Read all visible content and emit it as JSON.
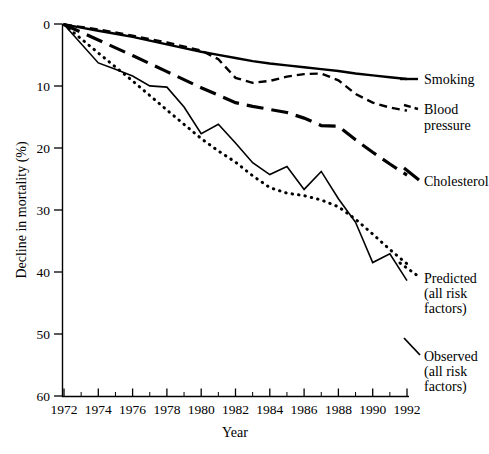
{
  "chart_data": {
    "type": "line",
    "title": "",
    "xlabel": "Year",
    "ylabel": "Decline in mortality (%)",
    "xlim": [
      1972,
      1992
    ],
    "ylim": [
      0,
      60
    ],
    "y_inverted": true,
    "grid": false,
    "legend_position": "right-inline-labels",
    "x_ticks_major": [
      1972,
      1974,
      1976,
      1978,
      1980,
      1982,
      1984,
      1986,
      1988,
      1990,
      1992
    ],
    "x_tick_labels": [
      "1972",
      "1974",
      "1976",
      "1978",
      "1980",
      "1982",
      "1984",
      "1986",
      "1988",
      "1990",
      "1992"
    ],
    "x_ticks_minor": [
      1973,
      1975,
      1977,
      1979,
      1981,
      1983,
      1985,
      1987,
      1989,
      1991
    ],
    "y_ticks": [
      0,
      10,
      20,
      30,
      40,
      50,
      60
    ],
    "y_tick_labels": [
      "0",
      "10",
      "20",
      "30",
      "40",
      "50",
      "60"
    ],
    "x": [
      1972,
      1973,
      1974,
      1975,
      1976,
      1977,
      1978,
      1979,
      1980,
      1981,
      1982,
      1983,
      1984,
      1985,
      1986,
      1987,
      1988,
      1989,
      1990,
      1991,
      1992
    ],
    "series": [
      {
        "name": "Smoking",
        "label": "Smoking",
        "style": "solid",
        "values": [
          0.0,
          0.6,
          1.2,
          1.8,
          2.4,
          3.0,
          3.6,
          4.2,
          4.8,
          5.2,
          5.6,
          6.0,
          6.3,
          6.6,
          6.9,
          7.2,
          7.5,
          7.8,
          8.1,
          8.4,
          8.7
        ]
      },
      {
        "name": "Blood pressure",
        "label": "Blood\npressure",
        "label_lines": [
          "Blood",
          "pressure"
        ],
        "style": "dashed",
        "values": [
          0.0,
          0.4,
          0.9,
          1.5,
          2.1,
          2.7,
          3.3,
          4.0,
          4.8,
          6.3,
          9.0,
          8.8,
          8.6,
          8.3,
          7.8,
          8.6,
          9.4,
          10.8,
          12.0,
          13.0,
          13.7
        ]
      },
      {
        "name": "Cholesterol",
        "label": "Cholesterol",
        "style": "long-dash",
        "values": [
          0.0,
          1.3,
          2.6,
          3.9,
          5.2,
          6.5,
          7.8,
          9.1,
          10.4,
          11.6,
          12.7,
          13.3,
          13.9,
          14.5,
          15.1,
          16.3,
          16.4,
          18.8,
          21.1,
          22.6,
          24.0
        ]
      },
      {
        "name": "Predicted (all risk factors)",
        "label_lines": [
          "Predicted",
          "(all risk",
          "factors)"
        ],
        "style": "dotted",
        "values": [
          0.0,
          2.2,
          4.6,
          7.0,
          9.3,
          11.7,
          14.0,
          16.4,
          18.5,
          20.3,
          22.0,
          24.0,
          26.0,
          27.2,
          27.8,
          28.2,
          29.2,
          31.2,
          33.8,
          36.2,
          38.5
        ]
      },
      {
        "name": "Observed (all risk factors)",
        "label_lines": [
          "Observed",
          "(all risk",
          "factors)"
        ],
        "style": "solid-thin",
        "values": [
          0.0,
          3.2,
          6.2,
          7.3,
          8.4,
          10.0,
          10.1,
          13.2,
          17.5,
          16.2,
          19.0,
          22.2,
          24.0,
          23.0,
          26.5,
          23.8,
          28.0,
          32.0,
          38.5,
          37.0,
          41.3
        ]
      }
    ],
    "observed_points": [
      [
        1972,
        0.0
      ],
      [
        1973,
        3.2
      ],
      [
        1974,
        6.2
      ],
      [
        1975,
        7.3
      ],
      [
        1976,
        8.4
      ],
      [
        1977,
        10.0
      ],
      [
        1978,
        10.1
      ],
      [
        1979,
        13.2
      ],
      [
        1980,
        17.5
      ],
      [
        1981,
        16.2
      ],
      [
        1982,
        19.0
      ],
      [
        1983,
        22.2
      ],
      [
        1984,
        24.0
      ],
      [
        1985,
        23.0
      ],
      [
        1986,
        26.5
      ],
      [
        1987,
        28.8
      ],
      [
        1988,
        29.0
      ],
      [
        1989,
        31.5
      ],
      [
        1990,
        34.3
      ],
      [
        1991,
        38.5
      ],
      [
        1992,
        42.0
      ]
    ]
  },
  "series_paths": {
    "smoking": "0,0 1,0.5 2,1.0 3,1.5 4,2.0 5,2.6 6,3.2 7,3.8 8,4.4 9,4.9 10,5.4 11,5.9 12,6.3 13,6.6 14,6.9 15,7.2 16,7.5 17,7.9 18,8.2 19,8.5 20,8.8",
    "blood_pressure": "0,0 2,0.8 4,1.8 6,2.9 8,4.2 9,5.6 10,8.6 11,9.4 12,9.1 13,8.4 14,8.0 15,7.9 16,9.0 17,11.2 18,12.6 19,13.4 20,13.9",
    "cholesterol": "0,0 2,2.5 4,5.0 6,7.6 8,10.2 10,12.6 11,13.2 12,13.7 13,14.2 14,15.1 15,16.3 16,16.4 17,18.6 18,20.6 19,22.5 20,24.3",
    "predicted": "0,0 2,4.6 4,9.1 6,13.8 8,18.4 9,20.4 10,22.2 11,24.4 12,26.3 13,27.2 14,27.6 15,28.3 16,29.4 17,31.4 18,33.8 19,36.3 20,38.6",
    "observed": "0,0 2,6.2 3,7.2 4,8.3 5,9.9 6,10.1 7,13.3 8,17.6 9,16.1 10,19.1 11,22.3 12,24.2 13,22.9 14,26.6 15,23.7 16,28.1 17,31.9 18,38.4 19,37.0 20,41.3"
  },
  "labels": {
    "y_axis_title": "Decline in mortality (%)",
    "x_axis_title": "Year",
    "smoking": "Smoking",
    "blood_1": "Blood",
    "blood_2": "pressure",
    "cholesterol": "Cholesterol",
    "predicted_1": "Predicted",
    "predicted_2": "(all risk",
    "predicted_3": "factors)",
    "observed_1": "Observed",
    "observed_2": "(all risk",
    "observed_3": "factors)",
    "y_0": "0",
    "y_10": "10",
    "y_20": "20",
    "y_30": "30",
    "y_40": "40",
    "y_50": "50",
    "y_60": "60",
    "x_1972": "1972",
    "x_1974": "1974",
    "x_1976": "1976",
    "x_1978": "1978",
    "x_1980": "1980",
    "x_1982": "1982",
    "x_1984": "1984",
    "x_1986": "1986",
    "x_1988": "1988",
    "x_1990": "1990",
    "x_1992": "1992"
  },
  "colors": {
    "ink": "#000000",
    "background": "#ffffff"
  }
}
